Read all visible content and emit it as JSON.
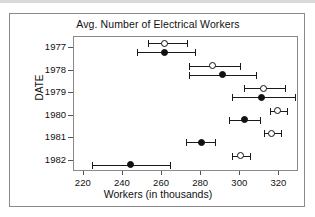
{
  "figure": {
    "title": "Avg. Number of Electrical Workers",
    "x_axis_label": "Workers (in thousands)",
    "y_axis_label": "DATE"
  },
  "chart_data": {
    "type": "scatter",
    "title": "Avg. Number of Electrical Workers",
    "xlabel": "Workers (in thousands)",
    "ylabel": "DATE",
    "orientation": "horizontal",
    "grid": false,
    "legend": "none",
    "xlim": [
      215,
      330
    ],
    "xticks": [
      220,
      240,
      260,
      280,
      300,
      320
    ],
    "categories": [
      "1977",
      "1978",
      "1979",
      "1980",
      "1981",
      "1982"
    ],
    "marker_styles": [
      "open-circle",
      "filled-circle"
    ],
    "series": [
      {
        "name": "open-circle",
        "marker": "open-circle",
        "values": [
          261,
          286,
          312,
          319,
          316,
          300
        ],
        "lower": [
          253,
          274,
          302,
          315,
          312,
          296
        ],
        "upper": [
          273,
          300,
          323,
          324,
          321,
          305
        ]
      },
      {
        "name": "filled-circle",
        "marker": "filled-circle",
        "values": [
          261,
          291,
          311,
          302,
          280,
          244
        ],
        "lower": [
          247,
          274,
          296,
          294,
          272,
          224
        ],
        "upper": [
          277,
          308,
          328,
          310,
          287,
          264
        ]
      }
    ]
  }
}
